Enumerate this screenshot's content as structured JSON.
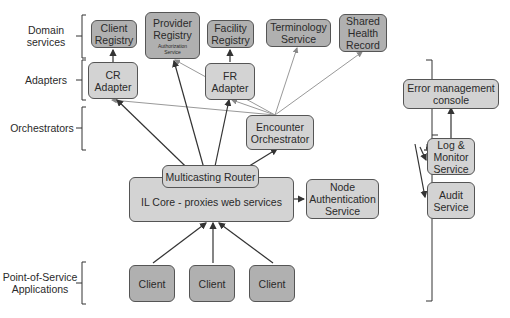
{
  "layers": [
    {
      "id": "domain",
      "label_lines": [
        "Domain",
        "services"
      ]
    },
    {
      "id": "adapters",
      "label_lines": [
        "Adapters"
      ]
    },
    {
      "id": "orchestrators",
      "label_lines": [
        "Orchestrators"
      ]
    },
    {
      "id": "pos",
      "label_lines": [
        "Point-of-Service",
        "Applications"
      ]
    }
  ],
  "nodes": {
    "client_registry": {
      "lines": [
        "Client",
        "Registry"
      ]
    },
    "provider_registry": {
      "lines": [
        "Provider",
        "Registry"
      ],
      "sub_lines": [
        "Authorization",
        "Service"
      ]
    },
    "facility_registry": {
      "lines": [
        "Facility",
        "Registry"
      ]
    },
    "terminology_service": {
      "lines": [
        "Terminology",
        "Service"
      ]
    },
    "shared_health_record": {
      "lines": [
        "Shared",
        "Health",
        "Record"
      ]
    },
    "cr_adapter": {
      "lines": [
        "CR",
        "Adapter"
      ]
    },
    "fr_adapter": {
      "lines": [
        "FR",
        "Adapter"
      ]
    },
    "encounter_orchestrator": {
      "lines": [
        "Encounter",
        "Orchestrator"
      ]
    },
    "multicasting_router": {
      "lines": [
        "Multicasting Router"
      ]
    },
    "il_core": {
      "lines": [
        "IL Core - proxies web services"
      ]
    },
    "node_auth": {
      "lines": [
        "Node",
        "Authentication",
        "Service"
      ]
    },
    "error_console": {
      "lines": [
        "Error management",
        "console"
      ]
    },
    "log_monitor": {
      "lines": [
        "Log &",
        "Monitor",
        "Service"
      ]
    },
    "audit_service": {
      "lines": [
        "Audit",
        "Service"
      ]
    },
    "clients": [
      {
        "lines": [
          "Client"
        ]
      },
      {
        "lines": [
          "Client"
        ]
      },
      {
        "lines": [
          "Client"
        ]
      }
    ]
  },
  "colors": {
    "domain_fill": "#b0b0b0",
    "component_fill": "#d3d3d3",
    "stroke": "#555555",
    "arrow_dark": "#333333",
    "arrow_light": "#999999"
  }
}
